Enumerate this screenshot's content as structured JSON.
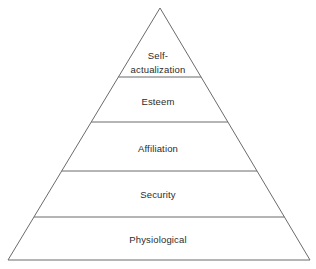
{
  "diagram": {
    "type": "pyramid",
    "name": "Maslow's Hierarchy of Needs",
    "background_color": "#ffffff",
    "line_color": "#6b6b6b",
    "text_color": "#2b2b2b",
    "apex": {
      "x": 160,
      "y": 8
    },
    "base_left": {
      "x": 8,
      "y": 260
    },
    "base_right": {
      "x": 310,
      "y": 260
    },
    "tiers": [
      {
        "id": "self-actualization",
        "label": "Self-\nactualization",
        "label_line_1": "Self-",
        "label_line_2": "actualization",
        "level": 5,
        "label_y": 49,
        "divider_y": 77
      },
      {
        "id": "esteem",
        "label": "Esteem",
        "level": 4,
        "label_y": 94,
        "divider_y": 122
      },
      {
        "id": "affiliation",
        "label": "Affiliation",
        "level": 3,
        "label_y": 141,
        "divider_y": 171
      },
      {
        "id": "security",
        "label": "Security",
        "level": 2,
        "label_y": 188,
        "divider_y": 217
      },
      {
        "id": "physiological",
        "label": "Physiological",
        "level": 1,
        "label_y": 233,
        "divider_y": 260
      }
    ]
  }
}
